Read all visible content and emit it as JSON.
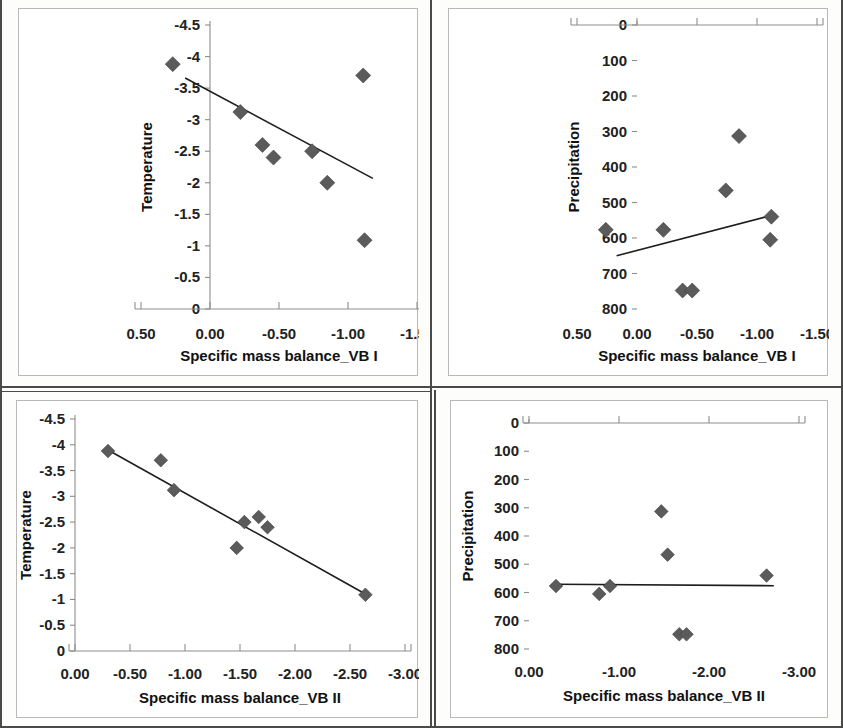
{
  "figure": {
    "marker_color": "#5b5b5b",
    "line_color": "#1d1d1d",
    "axis_color": "#8d8d8d"
  },
  "chart_data": [
    {
      "id": "tl",
      "type": "scatter",
      "title": "",
      "xlabel": "Specific mass balance_VB I",
      "ylabel": "Temperature",
      "xticks": [
        "0.50",
        "0.00",
        "-0.50",
        "-1.00",
        "-1.50"
      ],
      "xtick_values": [
        0.5,
        0.0,
        -0.5,
        -1.0,
        -1.5
      ],
      "yticks": [
        "-4.5",
        "-4",
        "-3.5",
        "-3",
        "-2.5",
        "-2",
        "-1.5",
        "-1",
        "-0.5",
        "0"
      ],
      "ytick_values": [
        -4.5,
        -4,
        -3.5,
        -3,
        -2.5,
        -2,
        -1.5,
        -1,
        -0.5,
        0
      ],
      "xlim": [
        0.5,
        -1.5
      ],
      "ylim": [
        -4.5,
        0
      ],
      "y_inverted": true,
      "grid": false,
      "legend": "none",
      "points": [
        {
          "x": 0.27,
          "y": -3.88
        },
        {
          "x": -0.22,
          "y": -3.12
        },
        {
          "x": -0.38,
          "y": -2.6
        },
        {
          "x": -0.46,
          "y": -2.4
        },
        {
          "x": -0.74,
          "y": -2.5
        },
        {
          "x": -0.85,
          "y": -2.0
        },
        {
          "x": -1.11,
          "y": -3.7
        },
        {
          "x": -1.12,
          "y": -1.09
        }
      ],
      "trend": {
        "x1": 0.18,
        "y1": -3.66,
        "x2": -1.18,
        "y2": -2.07
      }
    },
    {
      "id": "tr",
      "type": "scatter",
      "title": "",
      "xlabel": "Specific mass balance_VB I",
      "ylabel": "Precipitation",
      "xticks": [
        "0.50",
        "0.00",
        "-0.50",
        "-1.00",
        "-1.50"
      ],
      "xtick_values": [
        0.5,
        0.0,
        -0.5,
        -1.0,
        -1.5
      ],
      "yticks": [
        "800",
        "700",
        "600",
        "500",
        "400",
        "300",
        "200",
        "100",
        "0"
      ],
      "ytick_values": [
        800,
        700,
        600,
        500,
        400,
        300,
        200,
        100,
        0
      ],
      "xlim": [
        0.5,
        -1.5
      ],
      "ylim": [
        0,
        800
      ],
      "y_inverted": false,
      "grid": false,
      "legend": "none",
      "points": [
        {
          "x": 0.26,
          "y": 577
        },
        {
          "x": -0.22,
          "y": 577
        },
        {
          "x": -0.38,
          "y": 748
        },
        {
          "x": -0.46,
          "y": 748
        },
        {
          "x": -0.74,
          "y": 466
        },
        {
          "x": -0.85,
          "y": 313
        },
        {
          "x": -1.11,
          "y": 605
        },
        {
          "x": -1.12,
          "y": 540
        }
      ],
      "trend": {
        "x1": 0.17,
        "y1": 650,
        "x2": -1.16,
        "y2": 533
      }
    },
    {
      "id": "bl",
      "type": "scatter",
      "title": "",
      "xlabel": "Specific mass balance_VB II",
      "ylabel": "Temperature",
      "xticks": [
        "0.00",
        "-0.50",
        "-1.00",
        "-1.50",
        "-2.00",
        "-2.50",
        "-3.00"
      ],
      "xtick_values": [
        0.0,
        -0.5,
        -1.0,
        -1.5,
        -2.0,
        -2.5,
        -3.0
      ],
      "yticks": [
        "-4.5",
        "-4",
        "-3.5",
        "-3",
        "-2.5",
        "-2",
        "-1.5",
        "-1",
        "-0.5",
        "0"
      ],
      "ytick_values": [
        -4.5,
        -4,
        -3.5,
        -3,
        -2.5,
        -2,
        -1.5,
        -1,
        -0.5,
        0
      ],
      "xlim": [
        0.0,
        -3.0
      ],
      "ylim": [
        -4.5,
        0
      ],
      "y_inverted": true,
      "grid": false,
      "legend": "none",
      "points": [
        {
          "x": -0.3,
          "y": -3.88
        },
        {
          "x": -0.78,
          "y": -3.7
        },
        {
          "x": -0.9,
          "y": -3.12
        },
        {
          "x": -1.47,
          "y": -2.0
        },
        {
          "x": -1.54,
          "y": -2.5
        },
        {
          "x": -1.67,
          "y": -2.6
        },
        {
          "x": -1.75,
          "y": -2.4
        },
        {
          "x": -2.64,
          "y": -1.09
        }
      ],
      "trend": {
        "x1": -0.3,
        "y1": -3.9,
        "x2": -2.66,
        "y2": -1.08
      }
    },
    {
      "id": "br",
      "type": "scatter",
      "title": "",
      "xlabel": "Specific mass balance_VB II",
      "ylabel": "Precipitation",
      "xticks": [
        "0.00",
        "-1.00",
        "-2.00",
        "-3.00"
      ],
      "xtick_values": [
        0.0,
        -1.0,
        -2.0,
        -3.0
      ],
      "yticks": [
        "800",
        "700",
        "600",
        "500",
        "400",
        "300",
        "200",
        "100",
        "0"
      ],
      "ytick_values": [
        800,
        700,
        600,
        500,
        400,
        300,
        200,
        100,
        0
      ],
      "xlim": [
        0.0,
        -3.0
      ],
      "ylim": [
        0,
        800
      ],
      "y_inverted": false,
      "grid": false,
      "legend": "none",
      "points": [
        {
          "x": -0.3,
          "y": 577
        },
        {
          "x": -0.78,
          "y": 605
        },
        {
          "x": -0.9,
          "y": 577
        },
        {
          "x": -1.47,
          "y": 313
        },
        {
          "x": -1.54,
          "y": 466
        },
        {
          "x": -1.67,
          "y": 748
        },
        {
          "x": -1.75,
          "y": 748
        },
        {
          "x": -2.64,
          "y": 540
        }
      ],
      "trend": {
        "x1": -0.3,
        "y1": 571,
        "x2": -2.72,
        "y2": 576
      }
    }
  ]
}
